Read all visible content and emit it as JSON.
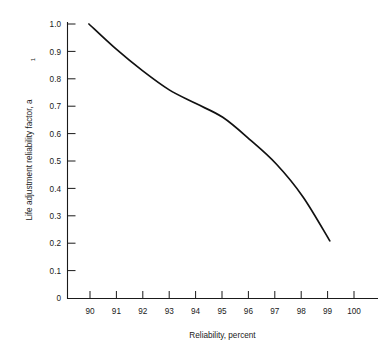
{
  "chart_data": {
    "type": "line",
    "title": "",
    "subtitle": "",
    "xlabel": "Reliability, percent",
    "ylabel": "Life adjustment reliability factor, a",
    "ylabel_subscript": "1",
    "x": [
      90,
      91,
      92,
      93,
      94,
      95,
      96,
      97,
      98,
      99
    ],
    "series": [
      {
        "name": "Life adjustment reliability factor",
        "values": [
          1.0,
          0.91,
          0.83,
          0.76,
          0.71,
          0.66,
          0.58,
          0.49,
          0.37,
          0.21
        ]
      }
    ],
    "xlim": [
      89.2,
      100.8
    ],
    "ylim": [
      0,
      1.0
    ],
    "xticks": [
      90,
      91,
      92,
      93,
      94,
      95,
      96,
      97,
      98,
      99,
      100
    ],
    "xtick_labels": [
      "90",
      "91",
      "92",
      "93",
      "94",
      "95",
      "96",
      "97",
      "98",
      "99",
      "100"
    ],
    "yticks": [
      0,
      0.1,
      0.2,
      0.3,
      0.4,
      0.5,
      0.6,
      0.7,
      0.8,
      0.9,
      1.0
    ],
    "ytick_labels": [
      "0",
      "0.1",
      "0.2",
      "0.3",
      "0.4",
      "0.5",
      "0.6",
      "0.7",
      "0.8",
      "0.9",
      "1.0"
    ],
    "grid": false,
    "legend": false,
    "legend_position": "none",
    "line_color": "#111111",
    "axis_color": "#1a1a1a",
    "background_color": "#ffffff"
  }
}
